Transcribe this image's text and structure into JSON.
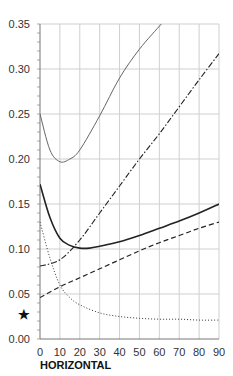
{
  "chart_data": {
    "type": "line",
    "title": "",
    "xlabel": "HORIZONTAL",
    "ylabel": "",
    "xlim": [
      0,
      90
    ],
    "ylim": [
      0,
      0.35
    ],
    "grid": true,
    "legend": null,
    "x_ticks": [
      "0",
      "10",
      "20",
      "30",
      "40",
      "50",
      "60",
      "70",
      "80",
      "90"
    ],
    "y_ticks": [
      "0.00",
      "0.05",
      "0.10",
      "0.15",
      "0.20",
      "0.25",
      "0.30",
      "0.35"
    ],
    "y_marker": {
      "label": "*",
      "value": 0.028
    },
    "series": [
      {
        "name": "thin-solid",
        "style": "solid-thin",
        "x": [
          0,
          5,
          10,
          15,
          20,
          30,
          40,
          50,
          61
        ],
        "y": [
          0.25,
          0.21,
          0.197,
          0.2,
          0.21,
          0.248,
          0.29,
          0.322,
          0.35
        ]
      },
      {
        "name": "dash-dot",
        "style": "dashdot",
        "x": [
          0,
          10,
          20,
          30,
          40,
          50,
          60,
          70,
          80,
          90
        ],
        "y": [
          0.081,
          0.088,
          0.11,
          0.14,
          0.17,
          0.2,
          0.228,
          0.258,
          0.288,
          0.317
        ]
      },
      {
        "name": "thick-solid",
        "style": "solid-thick",
        "x": [
          0,
          5,
          10,
          15,
          20,
          25,
          30,
          40,
          50,
          60,
          70,
          80,
          90
        ],
        "y": [
          0.172,
          0.135,
          0.112,
          0.104,
          0.101,
          0.101,
          0.103,
          0.108,
          0.115,
          0.123,
          0.131,
          0.14,
          0.15
        ]
      },
      {
        "name": "dashed",
        "style": "dashed",
        "x": [
          0,
          10,
          20,
          30,
          40,
          50,
          60,
          70,
          80,
          90
        ],
        "y": [
          0.046,
          0.058,
          0.068,
          0.078,
          0.088,
          0.098,
          0.107,
          0.115,
          0.123,
          0.13
        ]
      },
      {
        "name": "dotted",
        "style": "dotted",
        "x": [
          0,
          5,
          10,
          15,
          20,
          30,
          40,
          50,
          60,
          70,
          80,
          90
        ],
        "y": [
          0.13,
          0.09,
          0.06,
          0.046,
          0.038,
          0.029,
          0.025,
          0.023,
          0.022,
          0.022,
          0.021,
          0.021
        ]
      }
    ]
  }
}
